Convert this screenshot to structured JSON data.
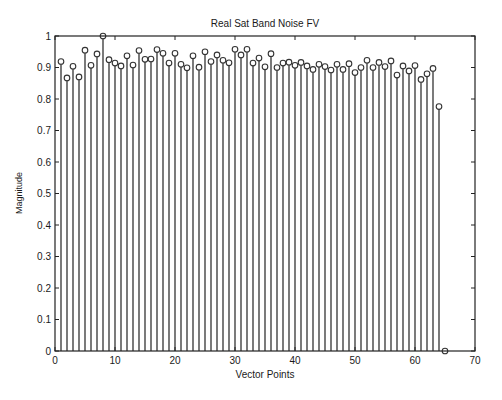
{
  "chart_data": {
    "type": "stem",
    "title": "Real Sat Band Noise FV",
    "xlabel": "Vector Points",
    "ylabel": "Magnitude",
    "xlim": [
      0,
      70
    ],
    "ylim": [
      0,
      1
    ],
    "xticks": [
      0,
      10,
      20,
      30,
      40,
      50,
      60,
      70
    ],
    "yticks": [
      0,
      0.1,
      0.2,
      0.3,
      0.4,
      0.5,
      0.6,
      0.7,
      0.8,
      0.9,
      1
    ],
    "ytick_labels": [
      "0",
      "0.1",
      "0.2",
      "0.3",
      "0.4",
      "0.5",
      "0.6",
      "0.7",
      "0.8",
      "0.9",
      "1"
    ],
    "grid": false,
    "legend": null,
    "marker": "circle",
    "x": [
      1,
      2,
      3,
      4,
      5,
      6,
      7,
      8,
      9,
      10,
      11,
      12,
      13,
      14,
      15,
      16,
      17,
      18,
      19,
      20,
      21,
      22,
      23,
      24,
      25,
      26,
      27,
      28,
      29,
      30,
      31,
      32,
      33,
      34,
      35,
      36,
      37,
      38,
      39,
      40,
      41,
      42,
      43,
      44,
      45,
      46,
      47,
      48,
      49,
      50,
      51,
      52,
      53,
      54,
      55,
      56,
      57,
      58,
      59,
      60,
      61,
      62,
      63,
      64,
      65
    ],
    "values": [
      0.919,
      0.867,
      0.904,
      0.87,
      0.955,
      0.907,
      0.943,
      1.0,
      0.925,
      0.914,
      0.905,
      0.937,
      0.908,
      0.954,
      0.926,
      0.927,
      0.957,
      0.945,
      0.914,
      0.945,
      0.91,
      0.899,
      0.937,
      0.901,
      0.95,
      0.919,
      0.94,
      0.923,
      0.915,
      0.958,
      0.94,
      0.958,
      0.914,
      0.93,
      0.902,
      0.944,
      0.9,
      0.914,
      0.917,
      0.907,
      0.916,
      0.905,
      0.894,
      0.91,
      0.903,
      0.892,
      0.91,
      0.894,
      0.912,
      0.884,
      0.9,
      0.923,
      0.9,
      0.916,
      0.903,
      0.921,
      0.876,
      0.905,
      0.889,
      0.906,
      0.862,
      0.88,
      0.897,
      0.776,
      0.0
    ]
  },
  "colors": {
    "axes": "#222222",
    "stem": "#333333",
    "marker_edge": "#333333",
    "background": "#ffffff"
  }
}
